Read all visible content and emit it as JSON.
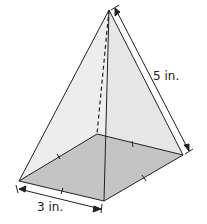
{
  "diagram": {
    "shape": "square pyramid",
    "labels": {
      "base_edge": "3 in.",
      "slant_edge": "5 in."
    },
    "colors": {
      "face_fill": "#eeeeee",
      "base_fill": "#c4c4c4",
      "stroke": "#222222"
    }
  }
}
